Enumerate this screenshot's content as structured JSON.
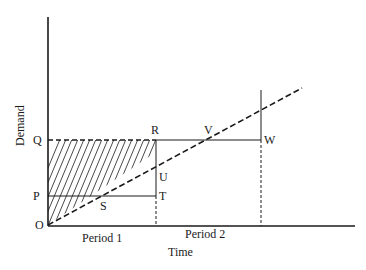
{
  "diagram": {
    "y_axis_label": "Demand",
    "x_axis_label": "Time",
    "periods": [
      "Period 1",
      "Period 2"
    ],
    "points": {
      "O": "O",
      "P": "P",
      "Q": "Q",
      "R": "R",
      "S": "S",
      "T": "T",
      "U": "U",
      "V": "V",
      "W": "W"
    },
    "colors": {
      "ink": "#1a1a1a",
      "background": "#ffffff"
    }
  }
}
